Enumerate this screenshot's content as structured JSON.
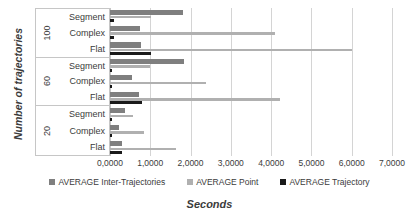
{
  "chart_data": {
    "type": "bar",
    "orientation": "horizontal",
    "title": "",
    "xlabel": "Seconds",
    "ylabel": "Number of trajectories",
    "xlim": [
      0,
      7
    ],
    "grid": true,
    "legend_position": "bottom",
    "groups": [
      {
        "group_label": "100",
        "categories": [
          "Segment",
          "Complex",
          "Flat"
        ]
      },
      {
        "group_label": "60",
        "categories": [
          "Segment",
          "Complex",
          "Flat"
        ]
      },
      {
        "group_label": "20",
        "categories": [
          "Segment",
          "Complex",
          "Flat"
        ]
      }
    ],
    "categories": [
      "100 Segment",
      "100 Complex",
      "100 Flat",
      "60 Segment",
      "60 Complex",
      "60 Flat",
      "20 Segment",
      "20 Complex",
      "20 Flat"
    ],
    "series": [
      {
        "name": "AVERAGE Inter-Trajectories",
        "color": "#7f7f7f",
        "values": [
          1.81,
          0.74,
          0.77,
          1.84,
          0.54,
          0.72,
          0.36,
          0.22,
          0.31
        ]
      },
      {
        "name": "AVERAGE Point",
        "color": "#b0b0b0",
        "values": [
          1.02,
          4.09,
          6.01,
          1.0,
          2.38,
          4.22,
          0.58,
          0.85,
          1.65
        ]
      },
      {
        "name": "AVERAGE Trajectory",
        "color": "#1a1a1a",
        "values": [
          0.09,
          0.1,
          1.03,
          0.06,
          0.06,
          0.8,
          0.04,
          0.04,
          0.31
        ]
      }
    ],
    "xticks": [
      "0,0000",
      "1,0000",
      "2,0000",
      "3,0000",
      "4,0000",
      "5,0000",
      "6,0000",
      "7,0000"
    ],
    "xtick_values": [
      0,
      1,
      2,
      3,
      4,
      5,
      6,
      7
    ]
  },
  "legend": {
    "items": [
      {
        "label": "AVERAGE Inter-Trajectories",
        "color": "#7f7f7f"
      },
      {
        "label": "AVERAGE Point",
        "color": "#b0b0b0"
      },
      {
        "label": "AVERAGE Trajectory",
        "color": "#1a1a1a"
      }
    ]
  }
}
